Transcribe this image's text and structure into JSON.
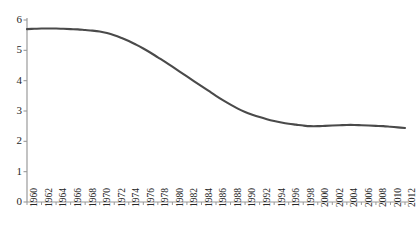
{
  "chart_data": {
    "type": "line",
    "title": "",
    "subtitle": "",
    "xlabel": "",
    "ylabel": "",
    "grid": false,
    "legend": false,
    "legend_position": "none",
    "line_color": "#4a4a4a",
    "axis_color": "#8c8c8c",
    "background": "#ffffff",
    "xlim": [
      1960,
      2012
    ],
    "ylim": [
      0,
      6
    ],
    "y_ticks": [
      0,
      1,
      2,
      3,
      4,
      5,
      6
    ],
    "x_tick_labels": [
      "1960",
      "1962",
      "1964",
      "1966",
      "1968",
      "1970",
      "1972",
      "1974",
      "1976",
      "1978",
      "1980",
      "1982",
      "1984",
      "1986",
      "1988",
      "1990",
      "1992",
      "1994",
      "1996",
      "1998",
      "2000",
      "2002",
      "2004",
      "2006",
      "2008",
      "2010",
      "2012"
    ],
    "x": [
      1960,
      1961,
      1962,
      1963,
      1964,
      1965,
      1966,
      1967,
      1968,
      1969,
      1970,
      1971,
      1972,
      1973,
      1974,
      1975,
      1976,
      1977,
      1978,
      1979,
      1980,
      1981,
      1982,
      1983,
      1984,
      1985,
      1986,
      1987,
      1988,
      1989,
      1990,
      1991,
      1992,
      1993,
      1994,
      1995,
      1996,
      1997,
      1998,
      1999,
      2000,
      2001,
      2002,
      2003,
      2004,
      2005,
      2006,
      2007,
      2008,
      2009,
      2010,
      2011,
      2012
    ],
    "values": [
      5.7,
      5.71,
      5.72,
      5.72,
      5.72,
      5.71,
      5.7,
      5.69,
      5.67,
      5.65,
      5.62,
      5.57,
      5.5,
      5.41,
      5.31,
      5.19,
      5.06,
      4.92,
      4.77,
      4.62,
      4.46,
      4.3,
      4.14,
      3.98,
      3.82,
      3.66,
      3.5,
      3.35,
      3.21,
      3.08,
      2.97,
      2.88,
      2.8,
      2.73,
      2.67,
      2.62,
      2.58,
      2.55,
      2.52,
      2.5,
      2.5,
      2.51,
      2.52,
      2.53,
      2.54,
      2.54,
      2.53,
      2.52,
      2.51,
      2.5,
      2.48,
      2.46,
      2.44
    ],
    "series": [
      {
        "name": "fertility-rate",
        "values": [
          5.7,
          5.71,
          5.72,
          5.72,
          5.72,
          5.71,
          5.7,
          5.69,
          5.67,
          5.65,
          5.62,
          5.57,
          5.5,
          5.41,
          5.31,
          5.19,
          5.06,
          4.92,
          4.77,
          4.62,
          4.46,
          4.3,
          4.14,
          3.98,
          3.82,
          3.66,
          3.5,
          3.35,
          3.21,
          3.08,
          2.97,
          2.88,
          2.8,
          2.73,
          2.67,
          2.62,
          2.58,
          2.55,
          2.52,
          2.5,
          2.5,
          2.51,
          2.52,
          2.53,
          2.54,
          2.54,
          2.53,
          2.52,
          2.51,
          2.5,
          2.48,
          2.46,
          2.44
        ]
      }
    ]
  },
  "axes": {
    "y_labels": [
      "6",
      "5",
      "4",
      "3",
      "2",
      "1",
      "0"
    ],
    "x_labels": [
      "1960",
      "1962",
      "1964",
      "1966",
      "1968",
      "1970",
      "1972",
      "1974",
      "1976",
      "1978",
      "1980",
      "1982",
      "1984",
      "1986",
      "1988",
      "1990",
      "1992",
      "1994",
      "1996",
      "1998",
      "2000",
      "2002",
      "2004",
      "2006",
      "2008",
      "2010",
      "2012"
    ]
  }
}
